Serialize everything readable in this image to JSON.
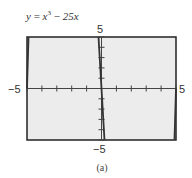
{
  "chart_data": {
    "type": "line",
    "equation": {
      "lhs": "y",
      "terms": [
        "x",
        "3",
        "25x"
      ]
    },
    "xlabel": "",
    "ylabel": "",
    "xlim": [
      -5,
      5
    ],
    "ylim": [
      -5,
      5
    ],
    "xticks_scale": 1,
    "yticks_scale": 1,
    "grid": false,
    "window_labels": {
      "xmin": "−5",
      "xmax": "5",
      "ymin": "−5",
      "ymax": "5"
    },
    "series": [
      {
        "name": "y = x^3 - 25x",
        "function": "x^3 - 25x"
      }
    ],
    "caption": "(a)"
  },
  "colors": {
    "background": "#ececec",
    "frame": "#222222",
    "axis": "#444444",
    "curve": "#333333"
  }
}
